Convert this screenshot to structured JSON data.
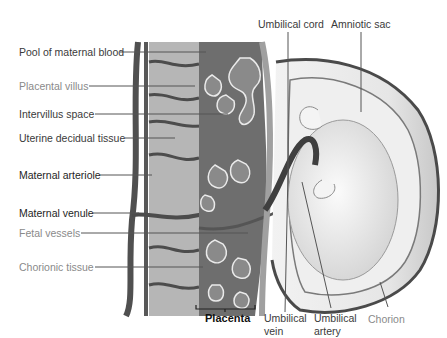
{
  "diagram": {
    "left_labels": [
      {
        "text": "Pool of maternal blood",
        "tone": "mid"
      },
      {
        "text": "Placental villus",
        "tone": "light"
      },
      {
        "text": "Intervillus space",
        "tone": "mid"
      },
      {
        "text": "Uterine decidual tissue",
        "tone": "mid"
      },
      {
        "text": "Maternal arteriole",
        "tone": "dark"
      },
      {
        "text": "Maternal venule",
        "tone": "dark"
      },
      {
        "text": "Fetal vessels",
        "tone": "light"
      },
      {
        "text": "Chorionic tissue",
        "tone": "light"
      }
    ],
    "top_labels": [
      {
        "text": "Umbilical cord"
      },
      {
        "text": "Amniotic sac"
      }
    ],
    "bottom_labels": {
      "placenta": "Placenta",
      "umbilical_vein_1": "Umbilical",
      "umbilical_vein_2": "vein",
      "umbilical_artery_1": "Umbilical",
      "umbilical_artery_2": "artery",
      "chorion": "Chorion"
    },
    "colors": {
      "maternal_vessel": "#4a4a4a",
      "tissue": "#b8b8b8",
      "blood_pool": "#6e6e6e",
      "sac": "#d9d9d9",
      "leader_line": "#555555"
    }
  }
}
